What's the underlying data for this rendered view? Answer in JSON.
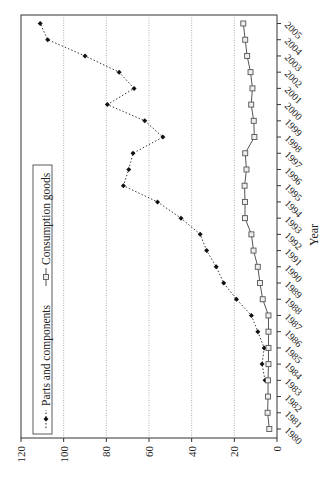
{
  "chart_data": {
    "type": "line",
    "orientation": "rotated-90-clockwise",
    "title": "",
    "xlabel": "Year",
    "ylabel": "",
    "ylim": [
      0,
      120
    ],
    "yticks": [
      0,
      20,
      40,
      60,
      80,
      100,
      120
    ],
    "grid": "horizontal-dotted",
    "legend_position": "top-left (rotated, along left edge)",
    "x": [
      1980,
      1981,
      1982,
      1983,
      1984,
      1985,
      1986,
      1987,
      1988,
      1989,
      1990,
      1991,
      1992,
      1993,
      1994,
      1995,
      1996,
      1997,
      1998,
      1999,
      2000,
      2001,
      2002,
      2003,
      2004,
      2005
    ],
    "series": [
      {
        "name": "Parts and components",
        "style": "dotted",
        "marker": "diamond-filled",
        "color": "#222222",
        "values": [
          null,
          null,
          null,
          5.6,
          7,
          6,
          9,
          12,
          19,
          25,
          28.5,
          33,
          36,
          45,
          56,
          72,
          69.5,
          67.5,
          53.5,
          62,
          79.5,
          67,
          74,
          90,
          107.5,
          111
        ]
      },
      {
        "name": "Consumption goods",
        "style": "solid",
        "marker": "square-open",
        "color": "#555555",
        "values": [
          3.6,
          4.4,
          4.2,
          4.2,
          4,
          4,
          4,
          4,
          6.7,
          8,
          9,
          11,
          12,
          15,
          15,
          15.2,
          14.3,
          14.9,
          10.6,
          10.9,
          12.1,
          11.5,
          12.4,
          14,
          14.9,
          15.8
        ]
      }
    ]
  },
  "legend": {
    "items": [
      {
        "label": "Parts and components"
      },
      {
        "label": "Consumption goods"
      }
    ]
  },
  "axis": {
    "x_label": "Year"
  }
}
